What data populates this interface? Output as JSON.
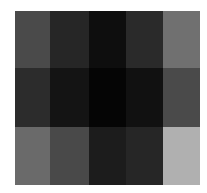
{
  "chart_data": {
    "type": "heatmap",
    "title": "",
    "xlabel": "",
    "ylabel": "",
    "colormap": "grayscale (0=black, 255=white)",
    "rows": 3,
    "cols": 5,
    "grid": false,
    "legend": null,
    "values": [
      [
        74,
        38,
        14,
        42,
        112
      ],
      [
        44,
        20,
        5,
        17,
        74
      ],
      [
        106,
        73,
        28,
        38,
        176
      ]
    ],
    "colors": [
      [
        "#4a4a4a",
        "#262626",
        "#0e0e0e",
        "#2a2a2a",
        "#707070"
      ],
      [
        "#2c2c2c",
        "#141414",
        "#050505",
        "#111111",
        "#4a4a4a"
      ],
      [
        "#6a6a6a",
        "#494949",
        "#1c1c1c",
        "#262626",
        "#b0b0b0"
      ]
    ]
  }
}
